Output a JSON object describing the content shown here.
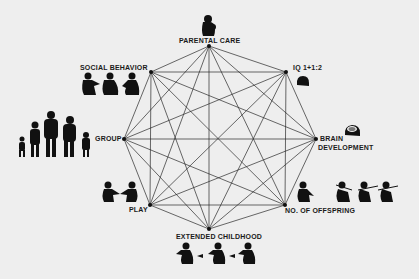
{
  "diagram": {
    "type": "octagon-complete-graph",
    "colors": {
      "background": "#eeeeee",
      "lines": "#2a2a2a",
      "figures": "#111111",
      "text": "#1a1a1a"
    },
    "nodes": [
      {
        "id": "parental_care",
        "label": "PARENTAL CARE",
        "x": 209,
        "y": 46,
        "icon": "mother-with-infant-icon"
      },
      {
        "id": "iq",
        "label": "IQ 1+1:2",
        "x": 286,
        "y": 72,
        "icon": "head-icon"
      },
      {
        "id": "brain_development",
        "label_line1": "BRAIN",
        "label_line2": "DEVELOPMENT",
        "x": 316,
        "y": 139,
        "icon": "brain-head-icon"
      },
      {
        "id": "no_of_offspring",
        "label": "NO. OF OFFSPRING",
        "x": 285,
        "y": 205,
        "icon": "hunters-with-spears-icon"
      },
      {
        "id": "extended_childhood",
        "label": "EXTENDED CHILDHOOD",
        "x": 209,
        "y": 229,
        "icon": "passing-figures-icon"
      },
      {
        "id": "play",
        "label": "PLAY",
        "x": 150,
        "y": 205,
        "icon": "two-figures-playing-icon"
      },
      {
        "id": "group",
        "label": "GROUP",
        "x": 124,
        "y": 139,
        "icon": "primate-group-icon"
      },
      {
        "id": "social_behavior",
        "label": "SOCIAL BEHAVIOR",
        "x": 151,
        "y": 72,
        "icon": "grooming-figures-icon"
      }
    ]
  }
}
